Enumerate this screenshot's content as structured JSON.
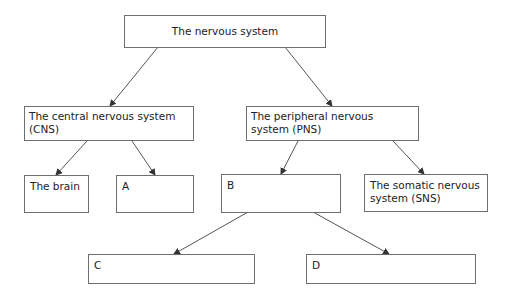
{
  "diagram": {
    "title": "The nervous system",
    "nodes": {
      "root": {
        "label": "The nervous system"
      },
      "cns": {
        "label": "The central nervous system (CNS)"
      },
      "pns": {
        "label": "The peripheral nervous system (PNS)"
      },
      "brain": {
        "label": "The brain"
      },
      "a": {
        "label": "A"
      },
      "b": {
        "label": "B"
      },
      "sns": {
        "label": "The somatic nervous system (SNS)"
      },
      "c": {
        "label": "C"
      },
      "d": {
        "label": "D"
      }
    },
    "edges": [
      {
        "from": "root",
        "to": "cns"
      },
      {
        "from": "root",
        "to": "pns"
      },
      {
        "from": "cns",
        "to": "brain"
      },
      {
        "from": "cns",
        "to": "a"
      },
      {
        "from": "pns",
        "to": "b"
      },
      {
        "from": "pns",
        "to": "sns"
      },
      {
        "from": "b",
        "to": "c"
      },
      {
        "from": "b",
        "to": "d"
      }
    ],
    "colors": {
      "border": "#6e6e6e",
      "arrow": "#555555",
      "text": "#222222"
    }
  }
}
